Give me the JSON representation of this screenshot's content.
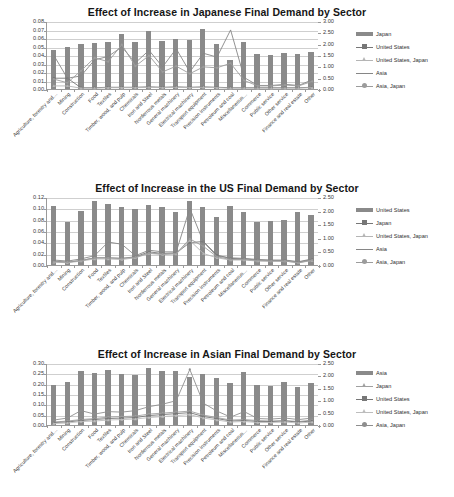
{
  "figure": {
    "background": "#ffffff",
    "bar_color": "#8a8a8a",
    "grid_color": "#cfcfcf",
    "axis_color": "#9a9a9a"
  },
  "categories": [
    "Agriculture, forestry and…",
    "Mining",
    "Construction",
    "Food",
    "Textiles",
    "Timber, wood, and pulp",
    "Chemicals",
    "Iron and Steel",
    "Nonferrous metals",
    "General machinery",
    "Electrical machinery",
    "Transport equipment",
    "Precision instruments",
    "Petroleum and coal",
    "Miscellaneous…",
    "Commerce",
    "Public service",
    "Other service",
    "Finance and real estate",
    "Other"
  ],
  "charts": [
    {
      "id": "chart-1",
      "chart_data": {
        "type": "bar",
        "title": "Effect of Increase in Japanese Final Demand by Sector",
        "xlabel": "",
        "ylabel": "",
        "grid": true,
        "legend_position": "right",
        "categories": [
          "Agriculture, forestry and…",
          "Mining",
          "Construction",
          "Food",
          "Textiles",
          "Timber, wood, and pulp",
          "Chemicals",
          "Iron and Steel",
          "Nonferrous metals",
          "General machinery",
          "Electrical machinery",
          "Transport equipment",
          "Precision instruments",
          "Petroleum and coal",
          "Miscellaneous…",
          "Commerce",
          "Public service",
          "Other service",
          "Finance and real estate",
          "Other"
        ],
        "left_axis": {
          "ylim": [
            0,
            0.08
          ],
          "ticks": [
            "0.00",
            "0.01",
            "0.02",
            "0.03",
            "0.04",
            "0.05",
            "0.06",
            "0.07",
            "0.08"
          ]
        },
        "right_axis": {
          "ylim": [
            0,
            3.0
          ],
          "ticks": [
            "0.00",
            "0.50",
            "1.00",
            "1.50",
            "2.00",
            "2.50",
            "3.00"
          ]
        },
        "series": [
          {
            "name": "Japan",
            "kind": "bar",
            "axis": "left",
            "color": "#8a8a8a",
            "values": [
              0.046,
              0.05,
              0.053,
              0.054,
              0.055,
              0.065,
              0.055,
              0.068,
              0.056,
              0.059,
              0.058,
              0.071,
              0.053,
              0.034,
              0.055,
              0.041,
              0.04,
              0.042,
              0.041,
              0.043
            ]
          },
          {
            "name": "United States",
            "kind": "line",
            "axis": "right",
            "color": "#777777",
            "marker": "square",
            "values": [
              0.52,
              0.52,
              0.1,
              0.1,
              0.12,
              0.12,
              0.12,
              0.14,
              0.12,
              0.14,
              0.12,
              0.14,
              0.12,
              0.1,
              0.1,
              0.1,
              0.1,
              0.1,
              0.1,
              0.12
            ]
          },
          {
            "name": "United States, Japan",
            "kind": "line",
            "axis": "right",
            "color": "#b5b5b5",
            "marker": "triangle",
            "values": [
              0.18,
              0.18,
              0.08,
              0.08,
              0.1,
              0.1,
              0.1,
              0.12,
              0.1,
              0.12,
              0.1,
              0.12,
              0.1,
              0.08,
              0.08,
              0.08,
              0.08,
              0.08,
              0.08,
              0.1
            ]
          },
          {
            "name": "Asia",
            "kind": "line",
            "axis": "right",
            "color": "#868686",
            "marker": "none",
            "values": [
              1.53,
              0.52,
              0.62,
              1.33,
              1.48,
              1.9,
              1.2,
              1.75,
              1.02,
              1.82,
              0.8,
              1.62,
              1.45,
              2.65,
              0.55,
              0.2,
              0.2,
              0.25,
              0.2,
              0.45
            ]
          },
          {
            "name": "Asia, Japan",
            "kind": "line",
            "axis": "right",
            "color": "#9c9c9c",
            "marker": "circle",
            "values": [
              0.48,
              0.32,
              0.85,
              1.42,
              1.25,
              2.0,
              1.05,
              1.52,
              0.8,
              1.05,
              0.72,
              1.02,
              0.98,
              1.18,
              0.42,
              0.18,
              0.18,
              0.22,
              0.18,
              0.38
            ]
          }
        ]
      }
    },
    {
      "id": "chart-2",
      "chart_data": {
        "type": "bar",
        "title": "Effect of Increase in the US Final Demand by Sector",
        "xlabel": "",
        "ylabel": "",
        "grid": true,
        "legend_position": "right",
        "categories": [
          "Agriculture, forestry and…",
          "Mining",
          "Construction",
          "Food",
          "Textiles",
          "Timber, wood, and pulp",
          "Chemicals",
          "Iron and Steel",
          "Nonferrous metals",
          "General machinery",
          "Electrical machinery",
          "Transport equipment",
          "Precision instruments",
          "Petroleum and coal",
          "Miscellaneous…",
          "Commerce",
          "Public service",
          "Other service",
          "Finance and real estate",
          "Other"
        ],
        "left_axis": {
          "ylim": [
            0,
            0.12
          ],
          "ticks": [
            "0.00",
            "0.02",
            "0.04",
            "0.06",
            "0.08",
            "0.10",
            "0.12"
          ]
        },
        "right_axis": {
          "ylim": [
            0,
            2.5
          ],
          "ticks": [
            "0.00",
            "0.50",
            "1.00",
            "1.50",
            "2.00",
            "2.50"
          ]
        },
        "series": [
          {
            "name": "United States",
            "kind": "bar",
            "axis": "left",
            "color": "#8a8a8a",
            "values": [
              0.105,
              0.076,
              0.095,
              0.113,
              0.107,
              0.103,
              0.099,
              0.106,
              0.102,
              0.093,
              0.113,
              0.102,
              0.084,
              0.104,
              0.094,
              0.076,
              0.078,
              0.08,
              0.093,
              0.088
            ]
          },
          {
            "name": "Japan",
            "kind": "line",
            "axis": "right",
            "color": "#777777",
            "marker": "square",
            "values": [
              0.18,
              0.14,
              0.2,
              0.3,
              0.3,
              0.28,
              0.34,
              0.52,
              0.46,
              0.48,
              0.86,
              0.9,
              0.4,
              0.28,
              0.26,
              0.22,
              0.2,
              0.2,
              0.14,
              0.24
            ]
          },
          {
            "name": "United States, Japan",
            "kind": "line",
            "axis": "right",
            "color": "#b5b5b5",
            "marker": "triangle",
            "values": [
              0.14,
              0.12,
              0.18,
              0.26,
              0.26,
              0.24,
              0.3,
              0.46,
              0.42,
              0.44,
              0.94,
              0.46,
              0.3,
              0.22,
              0.22,
              0.18,
              0.18,
              0.18,
              0.12,
              0.2
            ]
          },
          {
            "name": "Asia",
            "kind": "line",
            "axis": "right",
            "color": "#868686",
            "marker": "none",
            "values": [
              0.22,
              0.18,
              0.26,
              0.38,
              0.88,
              0.8,
              0.38,
              0.58,
              0.52,
              0.52,
              2.12,
              0.88,
              0.36,
              0.3,
              0.28,
              0.24,
              0.22,
              0.22,
              0.16,
              0.26
            ]
          },
          {
            "name": "Asia, Japan",
            "kind": "line",
            "axis": "right",
            "color": "#9c9c9c",
            "marker": "circle",
            "values": [
              0.16,
              0.14,
              0.2,
              0.3,
              0.3,
              0.28,
              0.32,
              0.48,
              0.44,
              0.46,
              1.0,
              0.72,
              0.34,
              0.24,
              0.24,
              0.2,
              0.18,
              0.18,
              0.12,
              0.22
            ]
          }
        ]
      }
    },
    {
      "id": "chart-3",
      "chart_data": {
        "type": "bar",
        "title": "Effect of Increase in Asian Final Demand by Sector",
        "xlabel": "",
        "ylabel": "",
        "grid": true,
        "legend_position": "right",
        "categories": [
          "Agriculture, forestry and…",
          "Mining",
          "Construction",
          "Food",
          "Textiles",
          "Timber, wood, and pulp",
          "Chemicals",
          "Iron and Steel",
          "Nonferrous metals",
          "General machinery",
          "Electrical machinery",
          "Transport equipment",
          "Precision instruments",
          "Petroleum and coal",
          "Miscellaneous…",
          "Commerce",
          "Public service",
          "Other service",
          "Finance and real estate",
          "Other"
        ],
        "left_axis": {
          "ylim": [
            0,
            0.3
          ],
          "ticks": [
            "0.00",
            "0.05",
            "0.10",
            "0.15",
            "0.20",
            "0.25",
            "0.30"
          ]
        },
        "right_axis": {
          "ylim": [
            0,
            2.5
          ],
          "ticks": [
            "0.00",
            "0.50",
            "1.00",
            "1.50",
            "2.00",
            "2.50"
          ]
        },
        "series": [
          {
            "name": "Asia",
            "kind": "bar",
            "axis": "left",
            "color": "#8a8a8a",
            "values": [
              0.194,
              0.206,
              0.259,
              0.251,
              0.266,
              0.249,
              0.244,
              0.274,
              0.261,
              0.261,
              0.234,
              0.248,
              0.229,
              0.203,
              0.255,
              0.194,
              0.187,
              0.208,
              0.184,
              0.205
            ]
          },
          {
            "name": "Japan",
            "kind": "line",
            "axis": "right",
            "color": "#a0a0a0",
            "marker": "triangle",
            "values": [
              0.16,
              0.2,
              0.26,
              0.3,
              0.36,
              0.38,
              0.4,
              0.48,
              0.52,
              0.56,
              0.6,
              0.44,
              0.34,
              0.24,
              0.26,
              0.22,
              0.2,
              0.22,
              0.18,
              0.24
            ]
          },
          {
            "name": "United States",
            "kind": "line",
            "axis": "right",
            "color": "#777777",
            "marker": "square",
            "values": [
              0.14,
              0.16,
              0.22,
              0.26,
              0.3,
              0.32,
              0.34,
              0.42,
              0.46,
              0.5,
              0.54,
              0.38,
              0.3,
              0.2,
              0.22,
              0.18,
              0.18,
              0.2,
              0.16,
              0.2
            ]
          },
          {
            "name": "United States, Japan",
            "kind": "line",
            "axis": "right",
            "color": "#bdbdbd",
            "marker": "triangle",
            "values": [
              0.1,
              0.12,
              0.18,
              0.2,
              0.24,
              0.26,
              0.28,
              0.34,
              0.38,
              0.42,
              0.46,
              0.32,
              0.24,
              0.16,
              0.18,
              0.14,
              0.14,
              0.16,
              0.12,
              0.16
            ]
          },
          {
            "name": "Asia, Japan",
            "kind": "line",
            "axis": "right",
            "color": "#8e8e8e",
            "marker": "circle",
            "values": [
              0.24,
              0.32,
              0.62,
              0.48,
              0.58,
              0.56,
              0.62,
              0.78,
              0.88,
              1.02,
              2.28,
              0.92,
              0.6,
              0.36,
              0.58,
              0.3,
              0.28,
              0.32,
              0.26,
              0.32
            ]
          }
        ]
      }
    }
  ]
}
